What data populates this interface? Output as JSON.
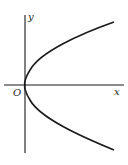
{
  "figure": {
    "type": "parabola-graph",
    "labels": {
      "x_axis": "x",
      "y_axis": "y",
      "origin": "O"
    },
    "colors": {
      "stroke": "#1a1a1a",
      "background": "#ffffff"
    }
  }
}
